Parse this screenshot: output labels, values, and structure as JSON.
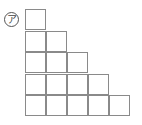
{
  "figure": {
    "label": "ア",
    "label_style": "circled",
    "grid": {
      "rows": [
        1,
        2,
        3,
        4,
        5
      ],
      "cell_size_px": 21,
      "origin": [
        25,
        9
      ],
      "line_color": "#8a8a8a"
    }
  }
}
